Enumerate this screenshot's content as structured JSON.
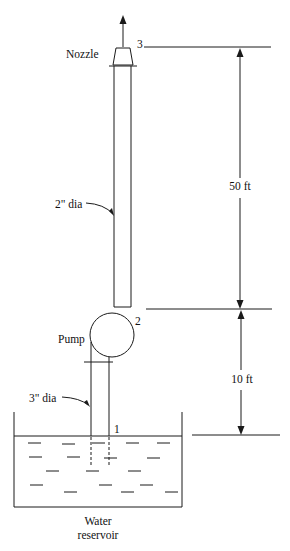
{
  "labels": {
    "nozzle": "Nozzle",
    "point3": "3",
    "point2": "2",
    "point1": "1",
    "pump": "Pump",
    "dia_upper": "2\" dia",
    "dia_lower": "3\" dia",
    "dim_upper": "50 ft",
    "dim_lower": "10 ft",
    "reservoir_line1": "Water",
    "reservoir_line2": "reservoir"
  },
  "colors": {
    "line": "#1a1a1a",
    "background": "#ffffff"
  }
}
